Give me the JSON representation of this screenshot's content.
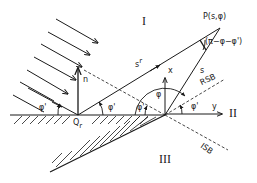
{
  "diagram": {
    "regions": {
      "region_1": "I",
      "region_2": "II",
      "region_3": "III"
    },
    "points": {
      "observation_point": "P(s,φ)",
      "reflection_point": "Q",
      "reflection_point_subscript": "r"
    },
    "vectors": {
      "normal": "n",
      "x_axis": "x",
      "y_axis": "y",
      "reflected_path": "s",
      "reflected_path_superscript": "r",
      "direct_path": "s"
    },
    "boundaries": {
      "reflection_shadow_boundary": "RSB",
      "incident_shadow_boundary": "ISB"
    },
    "angles": {
      "incident_angle": "φ'",
      "reflected_angle": "φ'",
      "observation_angle": "φ",
      "edge_incident_angle": "φ'",
      "rsb_angle": "φ'",
      "angle_at_P": "(π−φ−φ')"
    },
    "colors": {
      "line": "#1a1a1a",
      "background": "#ffffff"
    }
  }
}
